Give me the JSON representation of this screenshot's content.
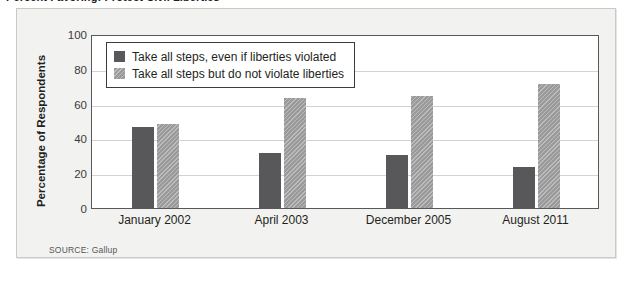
{
  "headline": "Percent Favoring: Protect Civil Liberties",
  "source_note": "SOURCE: Gallup",
  "legend": {
    "items": [
      {
        "label": "Take all steps, even if liberties violated",
        "color": "#58585a",
        "swatch": "dark"
      },
      {
        "label": "Take all steps but do not violate liberties",
        "color": "#9a9a9a",
        "swatch": "light"
      }
    ]
  },
  "chart_data": {
    "type": "bar",
    "title": "Percent Favoring: Protect Civil Liberties",
    "xlabel": "",
    "ylabel": "Percentage of Respondents",
    "ylim": [
      0,
      100
    ],
    "yticks": [
      0,
      20,
      40,
      60,
      80,
      100
    ],
    "grid": true,
    "legend_position": "top-left",
    "categories": [
      "January 2002",
      "April 2003",
      "December 2005",
      "August 2011"
    ],
    "series": [
      {
        "name": "Take all steps, even if liberties violated",
        "color": "#58585a",
        "values": [
          47,
          32,
          31,
          24
        ]
      },
      {
        "name": "Take all steps but do not violate liberties",
        "color": "#9a9a9a",
        "values": [
          49,
          64,
          65,
          72
        ]
      }
    ],
    "annotations": [
      "SOURCE: Gallup"
    ]
  }
}
